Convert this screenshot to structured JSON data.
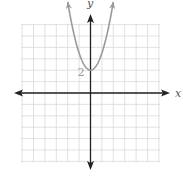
{
  "chart_data": {
    "type": "line",
    "title": "",
    "xlabel": "x",
    "ylabel": "y",
    "xlim": [
      -6,
      6
    ],
    "ylim": [
      -6,
      6
    ],
    "grid": true,
    "grid_step": 1,
    "legend": null,
    "series": [
      {
        "name": "parabola",
        "equation": "y = 1.5x^2 + 2",
        "color": "#9a9a9a",
        "x": [
          -2,
          -1.5,
          -1,
          -0.5,
          0,
          0.5,
          1,
          1.5,
          2
        ],
        "y": [
          8,
          5.375,
          3.5,
          2.375,
          2,
          2.375,
          3.5,
          5.375,
          8
        ],
        "arrows_at_ends": true
      }
    ],
    "annotations": [
      {
        "text": "2",
        "x": 0,
        "y": 2,
        "note": "y-intercept / vertex label"
      }
    ]
  },
  "labels": {
    "x_axis": "x",
    "y_axis": "y",
    "vertex": "2"
  },
  "colors": {
    "grid": "#d9d9d9",
    "axis": "#222222",
    "curve": "#9a9a9a",
    "label": "#999999"
  }
}
